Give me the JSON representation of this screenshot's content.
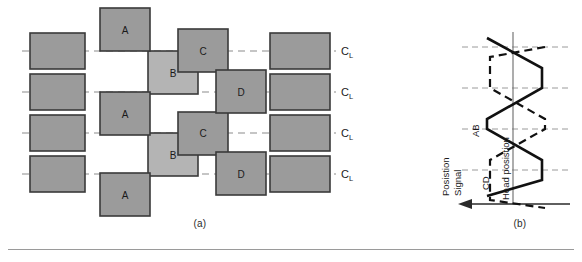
{
  "figure": {
    "title_a": "(a)",
    "title_b": "(b)",
    "panel_a": {
      "name": "servo-burst-pattern-layout",
      "track_label": "C",
      "track_label_sub": "L",
      "burst_labels": [
        "A",
        "B",
        "C",
        "D"
      ],
      "blocks": [
        {
          "id": "A1",
          "label": "A",
          "x": 100,
          "y": 8,
          "w": 50,
          "h": 43,
          "shade": "dark"
        },
        {
          "id": "A2",
          "label": "A",
          "x": 100,
          "y": 92,
          "w": 50,
          "h": 43,
          "shade": "dark"
        },
        {
          "id": "A3",
          "label": "A",
          "x": 100,
          "y": 173,
          "w": 50,
          "h": 43,
          "shade": "dark"
        },
        {
          "id": "B1",
          "label": "B",
          "x": 148,
          "y": 51,
          "w": 50,
          "h": 43,
          "shade": "light"
        },
        {
          "id": "B2",
          "label": "B",
          "x": 148,
          "y": 133,
          "w": 50,
          "h": 43,
          "shade": "light"
        },
        {
          "id": "C1",
          "label": "C",
          "x": 178,
          "y": 29,
          "w": 50,
          "h": 43,
          "shade": "dark"
        },
        {
          "id": "C2",
          "label": "C",
          "x": 178,
          "y": 112,
          "w": 50,
          "h": 43,
          "shade": "dark"
        },
        {
          "id": "D1",
          "label": "D",
          "x": 216,
          "y": 70,
          "w": 50,
          "h": 43,
          "shade": "dark"
        },
        {
          "id": "D2",
          "label": "D",
          "x": 216,
          "y": 152,
          "w": 50,
          "h": 43,
          "shade": "dark"
        }
      ],
      "left_rects": [
        {
          "id": "L1",
          "x": 30,
          "y": 33,
          "w": 55,
          "h": 36
        },
        {
          "id": "L2",
          "x": 30,
          "y": 74,
          "w": 55,
          "h": 36
        },
        {
          "id": "L3",
          "x": 30,
          "y": 115,
          "w": 55,
          "h": 36
        },
        {
          "id": "L4",
          "x": 30,
          "y": 156,
          "w": 55,
          "h": 36
        }
      ],
      "right_rects": [
        {
          "id": "R1",
          "x": 270,
          "y": 33,
          "w": 60,
          "h": 36
        },
        {
          "id": "R2",
          "x": 270,
          "y": 74,
          "w": 60,
          "h": 36
        },
        {
          "id": "R3",
          "x": 270,
          "y": 115,
          "w": 60,
          "h": 36
        },
        {
          "id": "R4",
          "x": 270,
          "y": 156,
          "w": 60,
          "h": 36
        }
      ],
      "centerlines_y": [
        51,
        92,
        133,
        174
      ],
      "centerline_x1": 22,
      "centerline_x2": 336
    },
    "panel_b": {
      "name": "position-error-signal-plot",
      "axis_label_vertical": "Posistion",
      "axis_label_vertical2": "Signal",
      "axis_label_horizontal": "Head posistion",
      "series": [
        {
          "name": "AB",
          "style": "solid"
        },
        {
          "name": "CD",
          "style": "dashed"
        }
      ]
    }
  },
  "colors": {
    "block_dark": "#9b9b9b",
    "block_light": "#b4b4b4",
    "block_edge": "#3a3a3a",
    "centerline": "#8c8c8c",
    "curve_solid": "#111111",
    "curve_dashed": "#111111",
    "axis": "#2a2a2a",
    "rule": "#9a9a9a"
  }
}
